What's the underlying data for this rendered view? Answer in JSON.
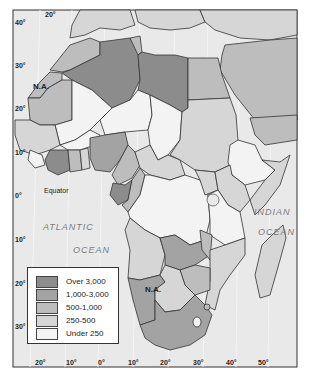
{
  "map": {
    "colors": {
      "over_3000": "#8c8c8c",
      "r1000_3000": "#a3a3a3",
      "r500_1000": "#bdbdbd",
      "r250_500": "#d6d6d6",
      "under_250": "#f3f3f3",
      "sea": "#e9e9e9",
      "border": "#333333"
    },
    "lat_labels": [
      "40°",
      "30°",
      "20°",
      "10°",
      "0°",
      "10°",
      "20°",
      "30°"
    ],
    "lon_top_label": "20°",
    "lon_bottom_labels": [
      "20°",
      "10°",
      "0°",
      "10°",
      "20°",
      "30°",
      "40°",
      "50°"
    ],
    "equator_label": "Equator",
    "oceans": {
      "atlantic_1": "ATLANTIC",
      "atlantic_2": "OCEAN",
      "indian_1": "INDIAN",
      "indian_2": "OCEAN"
    },
    "na_labels": [
      "N.A.",
      "N.A."
    ]
  },
  "legend": {
    "items": [
      {
        "label": "Over  3,000",
        "color": "#8c8c8c"
      },
      {
        "label": "1,000-3,000",
        "color": "#a3a3a3"
      },
      {
        "label": "500-1,000",
        "color": "#bdbdbd"
      },
      {
        "label": "250-500",
        "color": "#d6d6d6"
      },
      {
        "label": "Under  250",
        "color": "#f3f3f3"
      }
    ]
  }
}
